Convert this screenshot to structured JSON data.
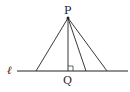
{
  "diagram": {
    "type": "geometry",
    "labels": {
      "point_p": "P",
      "point_q": "Q",
      "line": "ℓ"
    },
    "point_p": {
      "x": 68,
      "y": 18
    },
    "line_l": {
      "x1": 17,
      "x2": 128,
      "y": 71
    },
    "feet_x": [
      36,
      68,
      86,
      107
    ],
    "perpendicular_foot": "Q",
    "right_angle_marker": true,
    "colors": {
      "stroke": "#222222",
      "background": "#ffffff"
    }
  }
}
